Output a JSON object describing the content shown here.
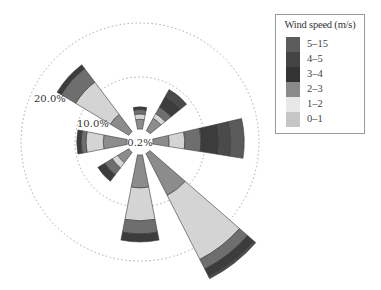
{
  "chart_data": {
    "type": "wind_rose",
    "title": "",
    "center_label": "0.2%",
    "ring_labels": [
      "10.0%",
      "20.0%"
    ],
    "ring_values": [
      10,
      20
    ],
    "legend_title": "Wind speed (m/s)",
    "speed_bins": [
      "0-1",
      "1-2",
      "2-3",
      "3-4",
      "4-5",
      "5-15"
    ],
    "bin_colors": {
      "0-1": "#8c8c8c",
      "1-2": "#d4d4d4",
      "2-3": "#6e6e6e",
      "3-4": "#3c3c3c",
      "4-5": "#4a4a4a",
      "5-15": "#5a5a5a"
    },
    "directions": [
      "N",
      "NE",
      "E",
      "SE",
      "S",
      "SW",
      "W",
      "NW"
    ],
    "direction_angles_deg": [
      0,
      40,
      88,
      142,
      180,
      228,
      270,
      312
    ],
    "cumulative_percent": {
      "N": [
        1.8,
        2.8,
        3.6,
        4.1,
        4.1,
        4.1
      ],
      "NE": [
        2.6,
        3.6,
        5.0,
        7.2,
        8.7,
        8.7
      ],
      "E": [
        3.0,
        5.9,
        8.9,
        12.2,
        14.4,
        16.9
      ],
      "SE": [
        8.7,
        22.0,
        24.0,
        25.6,
        26.0,
        26.0
      ],
      "S": [
        6.1,
        12.2,
        14.6,
        16.1,
        16.1,
        16.1
      ],
      "SW": [
        2.4,
        3.6,
        5.2,
        6.7,
        6.7,
        6.7
      ],
      "W": [
        4.4,
        7.6,
        8.5,
        9.3,
        9.3,
        9.3
      ],
      "NW": [
        4.0,
        11.5,
        14.6,
        15.5,
        15.5,
        15.5
      ]
    },
    "legend_position": "top-right",
    "grid": "dashed circles"
  },
  "legend": {
    "title": "Wind speed (m/s)",
    "items": [
      {
        "label": "5–15",
        "color": "#5c5c5c"
      },
      {
        "label": "4–5",
        "color": "#444444"
      },
      {
        "label": "3–4",
        "color": "#333333"
      },
      {
        "label": "2–3",
        "color": "#8a8a8a"
      },
      {
        "label": "1–2",
        "color": "#e8e8e8"
      },
      {
        "label": "0–1",
        "color": "#c6c6c6"
      }
    ]
  },
  "labels": {
    "center": "0.2%",
    "ring10": "10.0%",
    "ring20": "20.0%"
  }
}
